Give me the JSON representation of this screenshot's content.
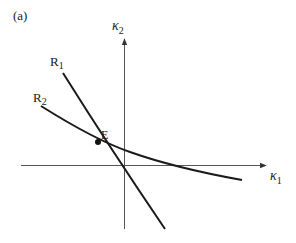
{
  "panel_label": "(a)",
  "axes": {
    "x_label": "κ",
    "x_sub": "1",
    "y_label": "κ",
    "y_sub": "2"
  },
  "curves": [
    {
      "id": "R1",
      "label": "R",
      "sub": "1"
    },
    {
      "id": "R2",
      "label": "R",
      "sub": "2"
    }
  ],
  "point": {
    "label": "E"
  },
  "colors": {
    "line": "#1a1a1a",
    "axis": "#555555"
  }
}
